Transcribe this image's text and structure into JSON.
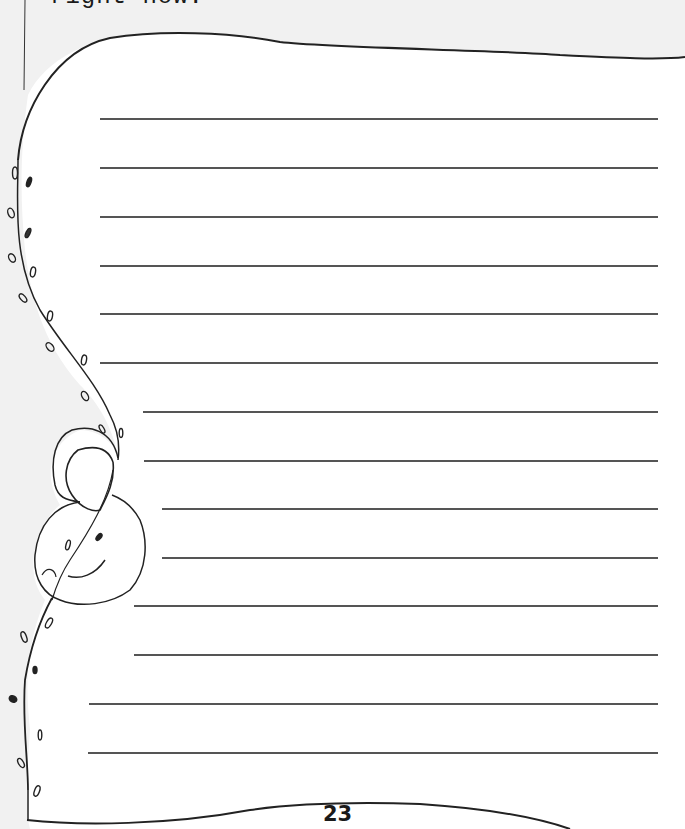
{
  "page": {
    "prompt_tail": "right now.",
    "page_number": "23",
    "background_color": "#f1f1f1",
    "paper_color": "#ffffff",
    "ink_color": "#1a1a1a",
    "line_color": "#555555"
  },
  "writing_lines": [
    {
      "y": 119,
      "x_start": 100,
      "x_end": 658
    },
    {
      "y": 168,
      "x_start": 100,
      "x_end": 658
    },
    {
      "y": 217,
      "x_start": 100,
      "x_end": 658
    },
    {
      "y": 266,
      "x_start": 100,
      "x_end": 658
    },
    {
      "y": 314,
      "x_start": 100,
      "x_end": 658
    },
    {
      "y": 363,
      "x_start": 100,
      "x_end": 658
    },
    {
      "y": 412,
      "x_start": 143,
      "x_end": 658
    },
    {
      "y": 461,
      "x_start": 144,
      "x_end": 658
    },
    {
      "y": 509,
      "x_start": 162,
      "x_end": 658
    },
    {
      "y": 558,
      "x_start": 162,
      "x_end": 658
    },
    {
      "y": 606,
      "x_start": 134,
      "x_end": 658
    },
    {
      "y": 655,
      "x_start": 134,
      "x_end": 658
    },
    {
      "y": 704,
      "x_start": 89,
      "x_end": 658
    },
    {
      "y": 753,
      "x_start": 88,
      "x_end": 658
    }
  ],
  "decoration": {
    "icon": "vine-with-leaves-and-sleeping-figure-icon"
  }
}
